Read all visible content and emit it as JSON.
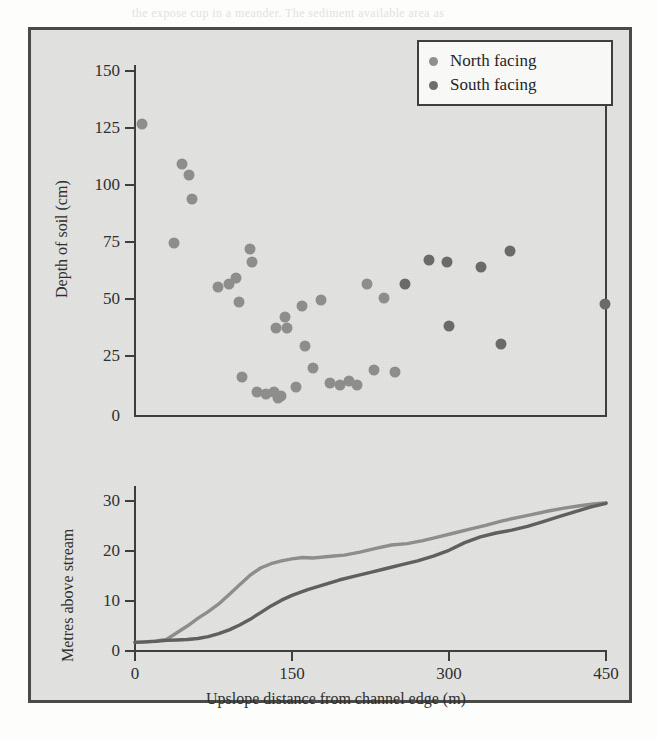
{
  "figure": {
    "legend": {
      "position": "top-right",
      "entries": [
        {
          "label": "North facing",
          "marker": "north-facing-dot",
          "color": "#909090"
        },
        {
          "label": "South facing",
          "marker": "south-facing-dot",
          "color": "#6d6d6d"
        }
      ]
    },
    "background_marginalia": [
      "the expose cup in a meander. The sediment available area as"
    ]
  },
  "chart_data": [
    {
      "id": "soil-depth-scatter",
      "type": "scatter",
      "title": "",
      "xlabel": "",
      "ylabel": "Depth of soil (cm)",
      "xlim": [
        0,
        450
      ],
      "ylim": [
        0,
        160
      ],
      "xticks": [
        0,
        150,
        300,
        450
      ],
      "yticks": [
        0,
        25,
        50,
        75,
        100,
        125,
        150
      ],
      "xticklabels": [
        "",
        "",
        "",
        ""
      ],
      "yticklabels": [
        "0",
        "25",
        "50",
        "75",
        "100",
        "125",
        "150"
      ],
      "grid": false,
      "legend_position": "upper right",
      "series": [
        {
          "name": "North facing",
          "color": "#8e8e8c",
          "points": [
            [
              8,
              133
            ],
            [
              38,
              79
            ],
            [
              46,
              115
            ],
            [
              52,
              110
            ],
            [
              55,
              99
            ],
            [
              80,
              59
            ],
            [
              90,
              60
            ],
            [
              97,
              63
            ],
            [
              100,
              52
            ],
            [
              103,
              18
            ],
            [
              110,
              76
            ],
            [
              112,
              70
            ],
            [
              117,
              11
            ],
            [
              126,
              10
            ],
            [
              133,
              11
            ],
            [
              135,
              40
            ],
            [
              137,
              8
            ],
            [
              140,
              9
            ],
            [
              144,
              45
            ],
            [
              146,
              40
            ],
            [
              154,
              13
            ],
            [
              160,
              50
            ],
            [
              163,
              32
            ],
            [
              170,
              22
            ],
            [
              178,
              53
            ],
            [
              186,
              15
            ],
            [
              196,
              14
            ],
            [
              205,
              16
            ],
            [
              212,
              14
            ],
            [
              222,
              60
            ],
            [
              228,
              21
            ],
            [
              238,
              54
            ],
            [
              248,
              20
            ]
          ]
        },
        {
          "name": "South facing",
          "color": "#6a6a68",
          "points": [
            [
              258,
              60
            ],
            [
              281,
              71
            ],
            [
              298,
              70
            ],
            [
              300,
              41
            ],
            [
              330,
              68
            ],
            [
              349,
              33
            ],
            [
              358,
              75
            ],
            [
              448,
              51
            ]
          ]
        }
      ]
    },
    {
      "id": "slope-profile",
      "type": "line",
      "title": "",
      "xlabel": "Upslope distance from channel edge (m)",
      "ylabel": "Metres above stream",
      "xlim": [
        0,
        450
      ],
      "ylim": [
        0,
        34
      ],
      "xticks": [
        0,
        150,
        300,
        450
      ],
      "yticks": [
        0,
        10,
        20,
        30
      ],
      "xticklabels": [
        "0",
        "150",
        "300",
        "450"
      ],
      "yticklabels": [
        "0",
        "10",
        "20",
        "30"
      ],
      "grid": false,
      "series": [
        {
          "name": "North facing",
          "color": "#8e8e8c",
          "x": [
            0,
            10,
            20,
            30,
            40,
            50,
            60,
            70,
            80,
            90,
            100,
            110,
            120,
            130,
            140,
            150,
            160,
            170,
            180,
            190,
            200,
            215,
            230,
            245,
            260,
            275,
            290,
            305,
            320,
            335,
            350,
            365,
            380,
            395,
            410,
            425,
            440,
            450
          ],
          "y": [
            1.6,
            1.7,
            1.9,
            2.2,
            3.6,
            5.0,
            6.6,
            8.0,
            9.6,
            11.6,
            13.6,
            15.6,
            17.1,
            18.0,
            18.6,
            19.0,
            19.3,
            19.2,
            19.4,
            19.6,
            19.8,
            20.4,
            21.2,
            21.9,
            22.2,
            22.8,
            23.6,
            24.4,
            25.2,
            26.0,
            26.9,
            27.6,
            28.3,
            29.0,
            29.6,
            30.1,
            30.5,
            30.7
          ]
        },
        {
          "name": "South facing",
          "color": "#5f5f5d",
          "x": [
            0,
            10,
            20,
            30,
            40,
            50,
            60,
            70,
            80,
            90,
            100,
            110,
            120,
            130,
            140,
            150,
            165,
            180,
            195,
            210,
            225,
            240,
            255,
            270,
            285,
            300,
            315,
            330,
            345,
            360,
            375,
            390,
            405,
            420,
            435,
            450
          ],
          "y": [
            1.6,
            1.7,
            1.8,
            2.0,
            2.1,
            2.2,
            2.4,
            2.8,
            3.4,
            4.2,
            5.2,
            6.4,
            7.8,
            9.2,
            10.4,
            11.4,
            12.6,
            13.6,
            14.6,
            15.4,
            16.2,
            17.0,
            17.8,
            18.6,
            19.6,
            20.8,
            22.4,
            23.6,
            24.4,
            25.0,
            25.8,
            26.8,
            27.8,
            28.8,
            29.8,
            30.6
          ]
        }
      ]
    }
  ]
}
